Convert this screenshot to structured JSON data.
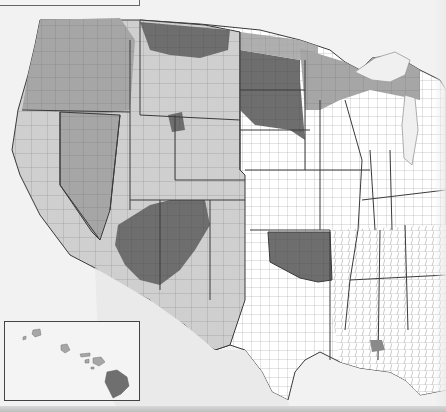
{
  "map": {
    "type": "choropleth",
    "subject": "US counties (western & central states) with grayscale shading",
    "shading_levels": [
      {
        "level": "none",
        "color": "#ffffff"
      },
      {
        "level": "low",
        "color": "#d4d4d4"
      },
      {
        "level": "medium",
        "color": "#a9a9a9"
      },
      {
        "level": "high",
        "color": "#6f6f6f"
      }
    ],
    "colors": {
      "background": "#f2f2f2",
      "water": "#f7f7f7",
      "state_border": "#3a3a3a",
      "county_border": "#9a9a9a"
    },
    "regions": [
      {
        "name": "Pacific Northwest",
        "shade": "medium"
      },
      {
        "name": "California",
        "shade": "low"
      },
      {
        "name": "Nevada",
        "shade": "medium"
      },
      {
        "name": "Four Corners (AZ/NM/UT/CO)",
        "shade": "high"
      },
      {
        "name": "Dakotas / Nebraska panhandle",
        "shade": "high"
      },
      {
        "name": "Oklahoma",
        "shade": "high"
      },
      {
        "name": "Texas",
        "shade": "none"
      },
      {
        "name": "Midwest / Iowa / Illinois",
        "shade": "none"
      },
      {
        "name": "Upper Great Lakes",
        "shade": "medium"
      },
      {
        "name": "Southeast",
        "shade": "none"
      }
    ],
    "inset": {
      "name": "Hawaii",
      "shade": "medium"
    }
  }
}
